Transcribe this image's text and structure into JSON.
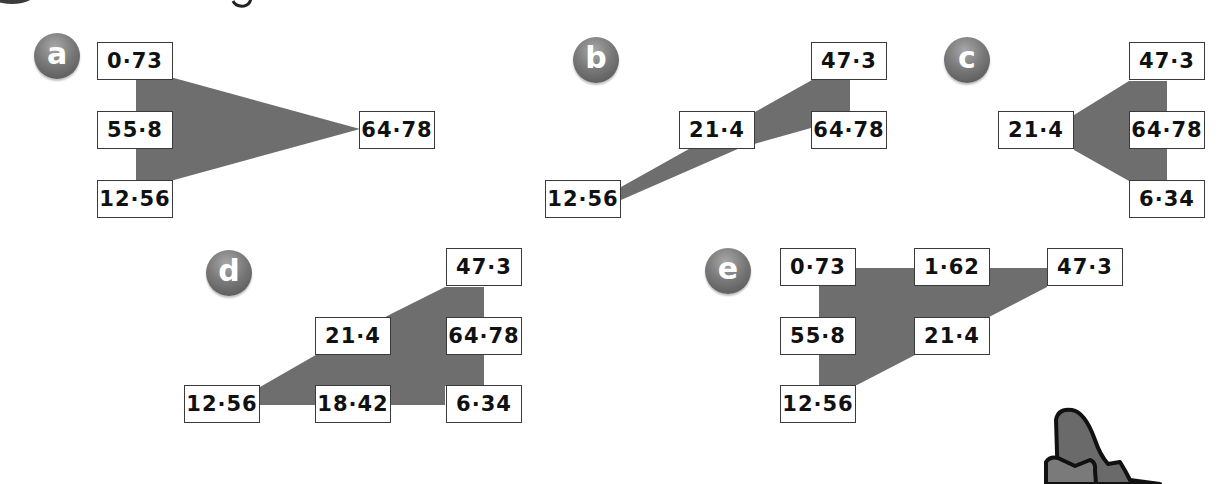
{
  "heading": {
    "number_badge_fragment": "",
    "title_fragment": "g"
  },
  "colors": {
    "shape_fill": "#6e6e6e",
    "badge_dark": "#4e4e4e",
    "box_border": "#3a3a3a",
    "text": "#111111"
  },
  "diagrams": [
    {
      "label": "a",
      "boxes": [
        "0·73",
        "55·8",
        "12·56",
        "64·78"
      ]
    },
    {
      "label": "b",
      "boxes": [
        "47·3",
        "21·4",
        "64·78",
        "12·56"
      ]
    },
    {
      "label": "c",
      "boxes": [
        "47·3",
        "21·4",
        "64·78",
        "6·34"
      ]
    },
    {
      "label": "d",
      "boxes": [
        "47·3",
        "21·4",
        "64·78",
        "12·56",
        "18·42",
        "6·34"
      ]
    },
    {
      "label": "e",
      "boxes": [
        "0·73",
        "1·62",
        "47·3",
        "55·8",
        "21·4",
        "12·56"
      ]
    }
  ],
  "decoration": {
    "character": "cartoon-character-ear-partial"
  }
}
